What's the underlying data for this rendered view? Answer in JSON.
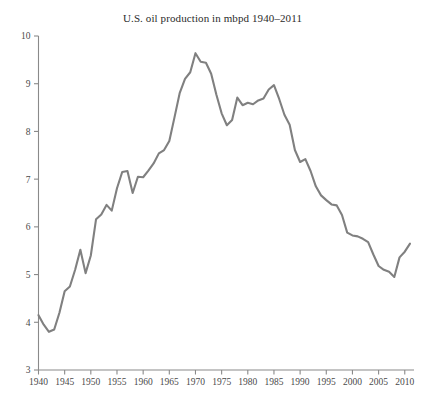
{
  "chart": {
    "title": "U.S. oil production in mbpd 1940–2011",
    "line_color": "#808080",
    "axis_color": "#8a8a8a",
    "background": "#ffffff"
  },
  "chart_data": {
    "type": "line",
    "title": "U.S. oil production in mbpd 1940–2011",
    "xlabel": "",
    "ylabel": "",
    "xlim": [
      1940,
      2011
    ],
    "ylim": [
      3,
      10
    ],
    "grid": false,
    "legend": null,
    "xticks": [
      1940,
      1945,
      1950,
      1955,
      1960,
      1965,
      1970,
      1975,
      1980,
      1985,
      1990,
      1995,
      2000,
      2005,
      2010
    ],
    "yticks": [
      3,
      4,
      5,
      6,
      7,
      8,
      9,
      10
    ],
    "series": [
      {
        "name": "U.S. oil production (mbpd)",
        "x": [
          1940,
          1941,
          1942,
          1943,
          1944,
          1945,
          1946,
          1947,
          1948,
          1949,
          1950,
          1951,
          1952,
          1953,
          1954,
          1955,
          1956,
          1957,
          1958,
          1959,
          1960,
          1961,
          1962,
          1963,
          1964,
          1965,
          1966,
          1967,
          1968,
          1969,
          1970,
          1971,
          1972,
          1973,
          1974,
          1975,
          1976,
          1977,
          1978,
          1979,
          1980,
          1981,
          1982,
          1983,
          1984,
          1985,
          1986,
          1987,
          1988,
          1989,
          1990,
          1991,
          1992,
          1993,
          1994,
          1995,
          1996,
          1997,
          1998,
          1999,
          2000,
          2001,
          2002,
          2003,
          2004,
          2005,
          2006,
          2007,
          2008,
          2009,
          2010,
          2011
        ],
        "y": [
          4.15,
          3.95,
          3.8,
          3.85,
          4.2,
          4.65,
          4.75,
          5.1,
          5.52,
          5.03,
          5.4,
          6.16,
          6.26,
          6.46,
          6.34,
          6.81,
          7.15,
          7.17,
          6.71,
          7.05,
          7.04,
          7.18,
          7.33,
          7.54,
          7.61,
          7.8,
          8.3,
          8.81,
          9.1,
          9.24,
          9.64,
          9.46,
          9.44,
          9.21,
          8.77,
          8.38,
          8.13,
          8.24,
          8.71,
          8.55,
          8.6,
          8.57,
          8.65,
          8.69,
          8.88,
          8.97,
          8.68,
          8.35,
          8.14,
          7.61,
          7.36,
          7.42,
          7.17,
          6.85,
          6.66,
          6.56,
          6.47,
          6.45,
          6.25,
          5.88,
          5.82,
          5.8,
          5.75,
          5.68,
          5.42,
          5.18,
          5.1,
          5.06,
          4.95,
          5.36,
          5.48,
          5.65
        ],
        "color": "#808080",
        "style": "solid"
      }
    ]
  }
}
